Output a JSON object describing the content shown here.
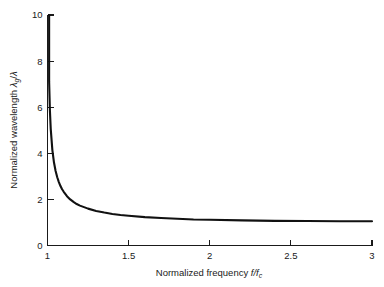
{
  "figure": {
    "name": "waveguide-normalized-wavelength-plot",
    "background_color": "#ffffff",
    "curve_color": "#111111",
    "axis_color": "#1a1a1a"
  },
  "axes": {
    "x_title_prefix": "Normalized frequency ",
    "x_title_symbol_num": "f",
    "x_title_slash": "/",
    "x_title_symbol_den": "f",
    "x_title_symbol_den_sub": "c",
    "y_title_prefix": "Normalized wavelength ",
    "y_title_symbol_num": "λ",
    "y_title_symbol_num_sub": "g",
    "y_title_slash": "/",
    "y_title_symbol_den": "λ"
  },
  "x_ticks": [
    {
      "value": 1,
      "label": "1"
    },
    {
      "value": 1.5,
      "label": "1.5"
    },
    {
      "value": 2,
      "label": "2"
    },
    {
      "value": 2.5,
      "label": "2.5"
    },
    {
      "value": 3,
      "label": "3"
    }
  ],
  "y_ticks": [
    {
      "value": 0,
      "label": "0"
    },
    {
      "value": 2,
      "label": "2"
    },
    {
      "value": 4,
      "label": "4"
    },
    {
      "value": 6,
      "label": "6"
    },
    {
      "value": 8,
      "label": "8"
    },
    {
      "value": 10,
      "label": "10"
    }
  ],
  "chart_data": {
    "type": "line",
    "title": "",
    "xlabel": "Normalized frequency f/f_c",
    "ylabel": "Normalized wavelength λ_g/λ",
    "xlim": [
      1,
      3
    ],
    "ylim": [
      0,
      10
    ],
    "grid": false,
    "legend": "none",
    "xticks": [
      1,
      1.5,
      2,
      2.5,
      3
    ],
    "yticks": [
      0,
      2,
      4,
      6,
      8,
      10
    ],
    "annotations": [
      "Vertical asymptote at f/f_c = 1 (curve clipped at top of axis, λ_g/λ ≈ 9.4)",
      "Horizontal asymptote approaching λ_g/λ = 1 as f/f_c → ∞"
    ],
    "series": [
      {
        "name": "λ_g/λ = 1/sqrt(1-(f_c/f)^2)",
        "x": [
          1.005,
          1.01,
          1.015,
          1.02,
          1.03,
          1.04,
          1.05,
          1.06,
          1.07,
          1.08,
          1.09,
          1.1,
          1.12,
          1.14,
          1.16,
          1.18,
          1.2,
          1.25,
          1.3,
          1.35,
          1.4,
          1.45,
          1.5,
          1.6,
          1.7,
          1.8,
          1.9,
          2.0,
          2.2,
          2.4,
          2.6,
          2.8,
          3.0
        ],
        "y": [
          10.05,
          7.12,
          5.83,
          5.05,
          4.14,
          3.6,
          3.23,
          2.96,
          2.75,
          2.58,
          2.44,
          2.33,
          2.14,
          2.0,
          1.89,
          1.8,
          1.73,
          1.6,
          1.5,
          1.43,
          1.37,
          1.32,
          1.29,
          1.23,
          1.19,
          1.16,
          1.13,
          1.12,
          1.09,
          1.07,
          1.06,
          1.05,
          1.05
        ]
      }
    ]
  }
}
